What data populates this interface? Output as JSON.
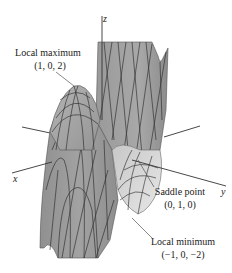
{
  "figure": {
    "axes": {
      "x": "x",
      "y": "y",
      "z": "z"
    },
    "annotations": [
      {
        "id": "local-max",
        "title": "Local maximum",
        "point": "(1, 0, 2)"
      },
      {
        "id": "saddle",
        "title": "Saddle point",
        "point": "(0, 1, 0)"
      },
      {
        "id": "local-min",
        "title": "Local minimum",
        "point": "(−1, 0, −2)"
      }
    ],
    "colors": {
      "surface_dark": "#8a8a8a",
      "surface_mid": "#a6a6a6",
      "surface_light": "#d4d4d4",
      "mesh": "#222222",
      "background": "#ffffff"
    }
  }
}
